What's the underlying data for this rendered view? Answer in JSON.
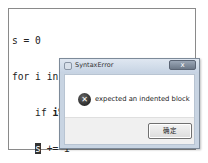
{
  "editor": {
    "lines": [
      {
        "parts": [
          {
            "text": "s = 0"
          }
        ]
      },
      {
        "parts": [
          {
            "text": "for i in range(1, 101):"
          }
        ]
      },
      {
        "parts": [
          {
            "text": "    if "
          },
          {
            "text": "i%2"
          },
          {
            "text": " != 0:"
          }
        ]
      },
      {
        "parts": [
          {
            "text": "    "
          },
          {
            "text": "s"
          },
          {
            "text": " += i"
          }
        ]
      },
      {
        "parts": [
          {
            "text": "print(s)"
          }
        ]
      }
    ]
  },
  "dialog": {
    "title": "SyntaxError",
    "close_label": "x",
    "icon": "error-icon",
    "icon_glyph": "✕",
    "message": "expected an indented block",
    "ok_label": "确定"
  }
}
